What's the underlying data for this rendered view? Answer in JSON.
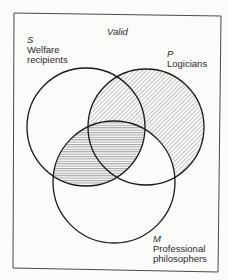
{
  "diagram": {
    "title": "Valid",
    "type": "venn-3-circle",
    "colors": {
      "background": "#fbfbfa",
      "stroke": "#1a1a1a",
      "hatch": "#6a6a6a",
      "frame": "#4a4a4a"
    },
    "sets": [
      {
        "letter": "S",
        "name": "Welfare recipients",
        "name_line1": "Welfare",
        "name_line2": "recipients",
        "cx": 86,
        "cy": 127,
        "r": 59
      },
      {
        "letter": "P",
        "name": "Logicians",
        "cx": 146,
        "cy": 127,
        "r": 58
      },
      {
        "letter": "M",
        "name": "Professional philosophers",
        "name_line1": "Professional",
        "name_line2": "philosophers",
        "cx": 114,
        "cy": 182,
        "r": 61
      }
    ],
    "shading": [
      {
        "region": "P only",
        "pattern": "diagonal"
      },
      {
        "region": "S∩P not M",
        "pattern": "diagonal"
      },
      {
        "region": "S∩M not P",
        "pattern": "horizontal"
      },
      {
        "region": "S∩P∩M",
        "pattern": "horizontal"
      }
    ]
  }
}
